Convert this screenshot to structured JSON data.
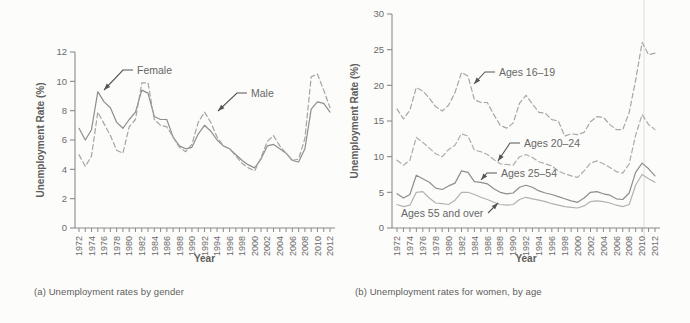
{
  "page": {
    "background_color": "#fcfcfa",
    "text_color": "#5d5d5d",
    "line_color_solid": "#8e8e8e",
    "line_color_dashed": "#a4a4a4"
  },
  "chart_data": [
    {
      "id": "unemployment-by-gender",
      "type": "line",
      "caption": "(a) Unemployment rates by gender",
      "xlabel": "Year",
      "ylabel": "Unemployment Rate (%)",
      "ylim": [
        0,
        12
      ],
      "yticks": [
        0,
        2,
        4,
        6,
        8,
        10,
        12
      ],
      "xlim": [
        1972,
        2012
      ],
      "xtick_labels": [
        "1972",
        "1974",
        "1976",
        "1978",
        "1980",
        "1982",
        "1984",
        "1986",
        "1988",
        "1990",
        "1992",
        "1994",
        "1996",
        "1998",
        "2000",
        "2002",
        "2004",
        "2006",
        "2008",
        "2010",
        "2012"
      ],
      "grid": false,
      "legend": "inline-annotations",
      "years_start": 1972,
      "series": [
        {
          "name": "Female",
          "style": "solid",
          "color": "#8e8e8e",
          "values": [
            6.8,
            6.0,
            6.7,
            9.3,
            8.6,
            8.2,
            7.2,
            6.8,
            7.4,
            7.9,
            9.4,
            9.2,
            7.6,
            7.4,
            7.4,
            6.2,
            5.6,
            5.4,
            5.5,
            6.4,
            7.0,
            6.6,
            6.0,
            5.6,
            5.4,
            5.0,
            4.6,
            4.3,
            4.1,
            4.7,
            5.6,
            5.7,
            5.4,
            5.1,
            4.6,
            4.5,
            5.4,
            8.1,
            8.6,
            8.5,
            7.9
          ]
        },
        {
          "name": "Male",
          "style": "dashed",
          "color": "#a4a4a4",
          "values": [
            5.0,
            4.2,
            4.9,
            7.9,
            7.1,
            6.3,
            5.3,
            5.1,
            6.9,
            7.4,
            9.9,
            9.9,
            7.4,
            7.0,
            6.9,
            6.2,
            5.5,
            5.2,
            5.7,
            7.2,
            7.9,
            7.2,
            6.2,
            5.6,
            5.4,
            4.9,
            4.4,
            4.1,
            3.9,
            4.8,
            5.9,
            6.3,
            5.6,
            5.1,
            4.6,
            4.7,
            6.1,
            10.3,
            10.5,
            9.4,
            8.2
          ]
        }
      ],
      "annotations": [
        {
          "text": "Female",
          "x": 137,
          "y": 74,
          "anchor": "start",
          "path": [
            [
              133,
              70
            ],
            [
              123,
              70
            ],
            [
              104,
              90
            ]
          ]
        },
        {
          "text": "Male",
          "x": 251,
          "y": 97,
          "anchor": "start",
          "path": [
            [
              247,
              93
            ],
            [
              237,
              93
            ],
            [
              218,
              111
            ]
          ]
        }
      ]
    },
    {
      "id": "unemployment-women-by-age",
      "type": "line",
      "caption": "(b) Unemployment rates for women, by age",
      "xlabel": "Year",
      "ylabel": "Unemployment Rate (%)",
      "ylim": [
        0,
        30
      ],
      "yticks": [
        0,
        5,
        10,
        15,
        20,
        25,
        30
      ],
      "xlim": [
        1972,
        2012
      ],
      "xtick_labels": [
        "1972",
        "1974",
        "1976",
        "1978",
        "1980",
        "1982",
        "1984",
        "1986",
        "1988",
        "1990",
        "1992",
        "1994",
        "1996",
        "1998",
        "2000",
        "2002",
        "2004",
        "2006",
        "2008",
        "2010",
        "2012"
      ],
      "grid": false,
      "legend": "inline-annotations",
      "years_start": 1972,
      "series": [
        {
          "name": "Ages 16–19",
          "style": "dashed",
          "color": "#a6a6a6",
          "values": [
            16.7,
            15.3,
            16.5,
            19.7,
            19.2,
            18.2,
            17.0,
            16.4,
            17.2,
            19.0,
            21.8,
            21.3,
            18.0,
            17.6,
            17.6,
            15.9,
            14.4,
            14.0,
            14.7,
            17.5,
            18.6,
            17.4,
            16.2,
            16.1,
            15.2,
            15.0,
            12.9,
            13.2,
            13.1,
            13.4,
            14.9,
            15.6,
            15.5,
            14.5,
            13.8,
            13.8,
            16.2,
            20.7,
            26.0,
            24.3,
            24.5
          ]
        },
        {
          "name": "Ages 20–24",
          "style": "dashed",
          "color": "#acacac",
          "values": [
            9.5,
            8.8,
            9.5,
            12.7,
            12.0,
            11.2,
            10.4,
            10.0,
            11.0,
            11.6,
            13.2,
            12.9,
            10.9,
            10.7,
            10.3,
            9.6,
            9.0,
            8.9,
            8.8,
            10.0,
            10.3,
            9.9,
            9.3,
            9.0,
            8.7,
            8.0,
            7.6,
            7.3,
            7.1,
            8.0,
            9.1,
            9.4,
            9.0,
            8.5,
            7.9,
            7.7,
            9.0,
            13.0,
            15.9,
            14.5,
            13.8
          ]
        },
        {
          "name": "Ages 25–54",
          "style": "solid",
          "color": "#8e8e8e",
          "values": [
            4.8,
            4.2,
            4.7,
            7.4,
            6.9,
            6.4,
            5.6,
            5.4,
            5.9,
            6.3,
            8.0,
            7.8,
            6.5,
            6.4,
            6.2,
            5.5,
            5.0,
            4.8,
            4.9,
            5.7,
            6.0,
            5.7,
            5.2,
            4.9,
            4.7,
            4.4,
            4.1,
            3.8,
            3.6,
            4.2,
            5.0,
            5.1,
            4.8,
            4.6,
            4.1,
            4.0,
            4.9,
            7.8,
            9.1,
            8.3,
            7.3
          ]
        },
        {
          "name": "Ages 55 and over",
          "style": "solid",
          "color": "#b2b2b2",
          "values": [
            3.3,
            3.0,
            3.2,
            5.0,
            5.1,
            4.2,
            3.5,
            3.4,
            3.3,
            3.9,
            5.0,
            5.0,
            4.7,
            4.3,
            4.0,
            3.6,
            3.3,
            3.2,
            3.3,
            4.0,
            4.3,
            4.1,
            3.9,
            3.7,
            3.4,
            3.2,
            3.0,
            2.9,
            2.8,
            3.1,
            3.7,
            3.8,
            3.7,
            3.5,
            3.2,
            3.0,
            3.3,
            6.0,
            7.5,
            6.9,
            6.4
          ]
        }
      ],
      "annotations": [
        {
          "text": "Ages 16–19",
          "x": 154,
          "y": 76,
          "anchor": "start",
          "path": [
            [
              150,
              72
            ],
            [
              140,
              72
            ],
            [
              129,
              84
            ]
          ]
        },
        {
          "text": "Ages 20–24",
          "x": 179,
          "y": 147,
          "anchor": "start",
          "path": [
            [
              175,
              143
            ],
            [
              165,
              143
            ],
            [
              153,
              161
            ]
          ]
        },
        {
          "text": "Ages 25–54",
          "x": 156,
          "y": 177,
          "anchor": "start",
          "path": [
            [
              152,
              173
            ],
            [
              142,
              173
            ],
            [
              136,
              180
            ]
          ]
        },
        {
          "text": "Ages 55 and over",
          "x": 56,
          "y": 217,
          "anchor": "start",
          "path": [
            [
              143,
              213
            ],
            [
              153,
              203
            ]
          ]
        }
      ]
    }
  ]
}
